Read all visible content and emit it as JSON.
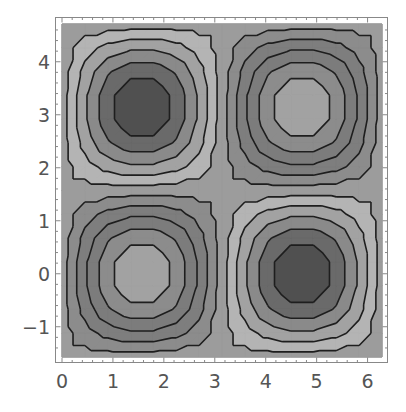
{
  "chart_data": {
    "type": "contour",
    "title": "",
    "xlabel": "",
    "ylabel": "",
    "function": "sin(x)*cos(y)",
    "xlim": [
      0,
      6.2832
    ],
    "ylim": [
      -1.5708,
      4.7124
    ],
    "x_ticks": [
      0,
      1,
      2,
      3,
      4,
      5,
      6
    ],
    "y_ticks": [
      -1,
      0,
      1,
      2,
      3,
      4
    ],
    "x_tick_labels": [
      "0",
      "1",
      "2",
      "3",
      "4",
      "5",
      "6"
    ],
    "y_tick_labels": [
      "-1",
      "0",
      "1",
      "2",
      "3",
      "4"
    ],
    "contour_levels": [
      -0.8182,
      -0.6364,
      -0.4545,
      -0.2727,
      -0.0909,
      0.0909,
      0.2727,
      0.4545,
      0.6364,
      0.8182
    ],
    "band_colors": [
      "#505050",
      "#6a6a6a",
      "#8a8a8a",
      "#a2a2a2",
      "#b4b4b4",
      "#9c9c9c",
      "#8c8c8c",
      "#7e7e7e",
      "#7c7c7c",
      "#8c8c8c",
      "#a2a2a2"
    ],
    "plot_points": 15,
    "extrema": [
      {
        "x": 1.5708,
        "y": 3.1416,
        "value": -1,
        "label": "minimum"
      },
      {
        "x": 4.7124,
        "y": 3.1416,
        "value": 1,
        "label": "maximum"
      },
      {
        "x": 1.5708,
        "y": 0,
        "value": 1,
        "label": "maximum"
      },
      {
        "x": 4.7124,
        "y": 0,
        "value": -1,
        "label": "minimum"
      }
    ],
    "grid": false,
    "legend": null,
    "frame": true
  }
}
